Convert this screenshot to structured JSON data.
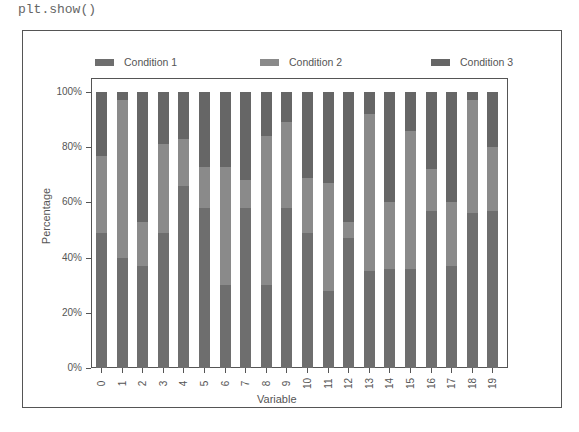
{
  "code_line": "plt.show()",
  "legend": [
    {
      "label": "Condition 1",
      "color": "#6e6e6e"
    },
    {
      "label": "Condition 2",
      "color": "#8a8a8a"
    },
    {
      "label": "Condition 3",
      "color": "#666666"
    }
  ],
  "axes": {
    "xlabel": "Variable",
    "ylabel": "Percentage",
    "yticks": [
      "0%",
      "20%",
      "40%",
      "60%",
      "80%",
      "100%"
    ]
  },
  "chart_data": {
    "type": "bar",
    "stacked": true,
    "normalized": true,
    "title": "",
    "xlabel": "Variable",
    "ylabel": "Percentage",
    "ylim": [
      0,
      100
    ],
    "yticks": [
      "0%",
      "20%",
      "40%",
      "60%",
      "80%",
      "100%"
    ],
    "legend_position": "top",
    "grid": false,
    "categories": [
      "0",
      "1",
      "2",
      "3",
      "4",
      "5",
      "6",
      "7",
      "8",
      "9",
      "10",
      "11",
      "12",
      "13",
      "14",
      "15",
      "16",
      "17",
      "18",
      "19"
    ],
    "series": [
      {
        "name": "Condition 1",
        "values": [
          49,
          40,
          37,
          49,
          66,
          58,
          30,
          58,
          30,
          58,
          49,
          28,
          47,
          35,
          36,
          36,
          57,
          37,
          56,
          57
        ]
      },
      {
        "name": "Condition 2",
        "values": [
          28,
          57,
          16,
          32,
          17,
          15,
          43,
          10,
          54,
          31,
          20,
          39,
          6,
          57,
          24,
          50,
          15,
          23,
          41,
          23
        ]
      },
      {
        "name": "Condition 3",
        "values": [
          23,
          3,
          47,
          19,
          17,
          27,
          27,
          32,
          16,
          11,
          31,
          33,
          47,
          8,
          40,
          14,
          28,
          40,
          3,
          20
        ]
      }
    ]
  }
}
